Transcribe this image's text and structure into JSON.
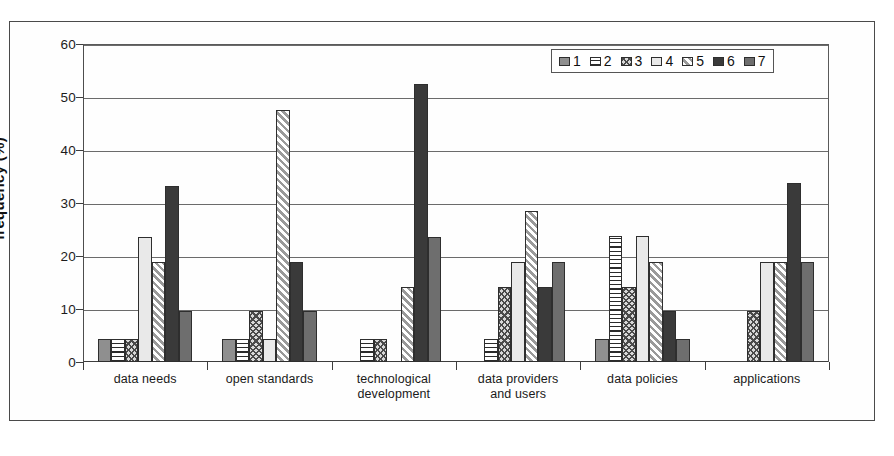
{
  "chart_data": {
    "type": "bar",
    "title": "",
    "xlabel": "",
    "ylabel": "frequency (%)",
    "ylim": [
      0,
      60
    ],
    "yticks": [
      0,
      10,
      20,
      30,
      40,
      50,
      60
    ],
    "grid": true,
    "legend_position": "top-right",
    "categories": [
      "data needs",
      "open standards",
      "technological development",
      "data providers and users",
      "data policies",
      "applications"
    ],
    "category_lines": [
      [
        "data needs"
      ],
      [
        "open standards"
      ],
      [
        "technological",
        "development"
      ],
      [
        "data providers",
        "and users"
      ],
      [
        "data policies"
      ],
      [
        "applications"
      ]
    ],
    "series": [
      {
        "name": "1",
        "pattern": "solid-medium-gray",
        "color": "#8f8f8f",
        "values": [
          4.3,
          4.3,
          0,
          0,
          4.3,
          0
        ]
      },
      {
        "name": "2",
        "pattern": "horizontal-lines",
        "color": "#2b2b2b",
        "values": [
          4.3,
          4.3,
          4.3,
          4.3,
          23.7,
          0
        ]
      },
      {
        "name": "3",
        "pattern": "crosshatch-dots",
        "color": "#4a4a4a",
        "values": [
          4.3,
          9.7,
          4.3,
          14.2,
          14.2,
          9.7
        ]
      },
      {
        "name": "4",
        "pattern": "solid-light-gray",
        "color": "#e9e9e9",
        "values": [
          23.5,
          4.3,
          0,
          18.8,
          23.7,
          18.8
        ]
      },
      {
        "name": "5",
        "pattern": "diagonal-hatch",
        "color": "#c9c9c9",
        "values": [
          18.8,
          47.5,
          14.2,
          28.5,
          18.8,
          18.8
        ]
      },
      {
        "name": "6",
        "pattern": "solid-dark",
        "color": "#3a3a3a",
        "values": [
          33.3,
          18.8,
          52.4,
          14.2,
          9.7,
          33.7
        ]
      },
      {
        "name": "7",
        "pattern": "solid-dark-gray",
        "color": "#6e6e6e",
        "values": [
          9.7,
          9.7,
          23.6,
          18.8,
          4.3,
          18.8
        ]
      }
    ]
  },
  "legend": {
    "items": [
      {
        "label": "1"
      },
      {
        "label": "2"
      },
      {
        "label": "3"
      },
      {
        "label": "4"
      },
      {
        "label": "5"
      },
      {
        "label": "6"
      },
      {
        "label": "7"
      }
    ]
  }
}
